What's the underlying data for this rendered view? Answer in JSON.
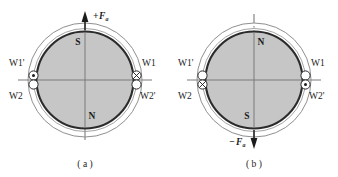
{
  "figure": {
    "colors": {
      "rotor_fill": "#c6c6c6",
      "rotor_outline": "#2b2b2b",
      "stator_outline": "#8f8f8f",
      "axis_line": "#7a7a7a",
      "text": "#1b1b1b",
      "background": "#ffffff"
    },
    "panels": [
      {
        "id": "a",
        "caption": "( a )",
        "pole_top": "S",
        "pole_bottom": "N",
        "force": {
          "sign": "+",
          "symbol": "F",
          "subscript": "a",
          "label": "+Fa",
          "direction": "up",
          "position": "top"
        },
        "vertical_axis_style": "solid",
        "windings": [
          {
            "name": "W1'",
            "side": "left",
            "slot": "upper",
            "current": "out-of-page",
            "marker": "dot"
          },
          {
            "name": "W2",
            "side": "left",
            "slot": "lower",
            "current": "none",
            "marker": "empty"
          },
          {
            "name": "W1",
            "side": "right",
            "slot": "upper",
            "current": "into-page",
            "marker": "cross"
          },
          {
            "name": "W2'",
            "side": "right",
            "slot": "lower",
            "current": "none",
            "marker": "empty"
          }
        ]
      },
      {
        "id": "b",
        "caption": "( b )",
        "pole_top": "N",
        "pole_bottom": "S",
        "force": {
          "sign": "−",
          "symbol": "F",
          "subscript": "a",
          "label": "−Fa",
          "direction": "down",
          "position": "bottom"
        },
        "vertical_axis_style": "dash-dot",
        "windings": [
          {
            "name": "W1'",
            "side": "left",
            "slot": "upper",
            "current": "none",
            "marker": "empty"
          },
          {
            "name": "W2",
            "side": "left",
            "slot": "lower",
            "current": "into-page",
            "marker": "cross"
          },
          {
            "name": "W1",
            "side": "right",
            "slot": "upper",
            "current": "none",
            "marker": "empty"
          },
          {
            "name": "W2'",
            "side": "right",
            "slot": "lower",
            "current": "out-of-page",
            "marker": "dot"
          }
        ]
      }
    ]
  }
}
